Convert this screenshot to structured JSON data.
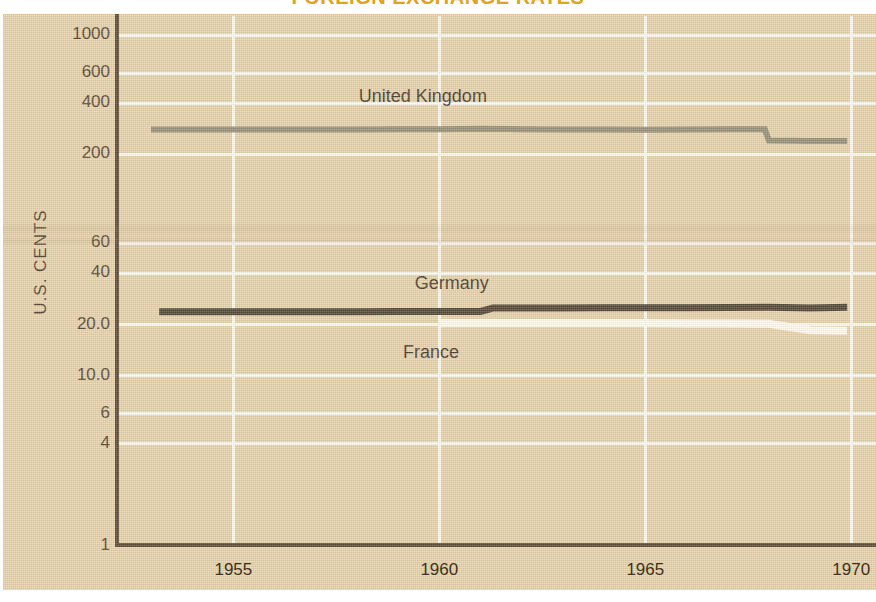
{
  "title": "FOREIGN EXCHANGE RATES",
  "colors": {
    "background": "#e2cfa8",
    "grid": "#fdfbf2",
    "axis": "#463925",
    "title": "#e0a21f",
    "united_kingdom": "#8a8570",
    "germany": "#3d3426",
    "france": "#fffdf4"
  },
  "axes": {
    "y_title": "U.S. CENTS",
    "y_ticks": [
      "1000",
      "600",
      "400",
      "200",
      "60",
      "40",
      "20.0",
      "10.0",
      "6",
      "4",
      "1"
    ],
    "x_ticks": [
      "1955",
      "1960",
      "1965",
      "1970"
    ]
  },
  "series_labels": {
    "united_kingdom": "United Kingdom",
    "germany": "Germany",
    "france": "France"
  },
  "chart_data": {
    "type": "line",
    "title": "FOREIGN EXCHANGE RATES",
    "xlabel": "",
    "ylabel": "U.S. CENTS",
    "yscale": "log",
    "ylim": [
      1,
      1300
    ],
    "xlim": [
      1952.2,
      1970.6
    ],
    "grid": true,
    "legend": "inline-labels",
    "y_tick_values": [
      1000,
      600,
      400,
      200,
      60,
      40,
      20.0,
      10.0,
      6,
      4,
      1
    ],
    "x_tick_values": [
      1955,
      1960,
      1965,
      1970
    ],
    "series": [
      {
        "name": "United Kingdom",
        "color": "#8a8570",
        "x": [
          1953.0,
          1954.0,
          1955.0,
          1956.0,
          1957.0,
          1958.0,
          1959.0,
          1960.0,
          1961.0,
          1962.0,
          1963.0,
          1964.0,
          1965.0,
          1966.0,
          1967.0,
          1967.9,
          1968.0,
          1969.0,
          1969.9
        ],
        "y": [
          280,
          280,
          280,
          280,
          280,
          280,
          281,
          281,
          283,
          281,
          280,
          280,
          279,
          280,
          281,
          281,
          241,
          240,
          240
        ]
      },
      {
        "name": "Germany",
        "color": "#3d3426",
        "x": [
          1953.2,
          1954.0,
          1955.0,
          1956.0,
          1957.0,
          1958.0,
          1959.0,
          1960.0,
          1961.0,
          1961.3,
          1962.0,
          1963.0,
          1964.0,
          1965.0,
          1966.0,
          1967.0,
          1968.0,
          1969.0,
          1969.9
        ],
        "y": [
          23.8,
          23.8,
          23.8,
          23.8,
          23.8,
          23.8,
          23.9,
          23.9,
          23.9,
          25.0,
          25.0,
          25.0,
          25.1,
          25.1,
          25.1,
          25.2,
          25.3,
          25.0,
          25.3
        ]
      },
      {
        "name": "France",
        "color": "#fffdf4",
        "x": [
          1960.0,
          1961.0,
          1962.0,
          1963.0,
          1964.0,
          1965.0,
          1966.0,
          1967.0,
          1968.0,
          1969.0,
          1969.9
        ],
        "y": [
          20.4,
          20.4,
          20.4,
          20.4,
          20.4,
          20.4,
          20.3,
          20.3,
          20.2,
          18.5,
          18.4
        ]
      }
    ],
    "annotations": [
      {
        "text": "United Kingdom",
        "x": 1959.6,
        "y": 430
      },
      {
        "text": "Germany",
        "x": 1960.3,
        "y": 34
      },
      {
        "text": "France",
        "x": 1959.8,
        "y": 13.5
      }
    ]
  }
}
